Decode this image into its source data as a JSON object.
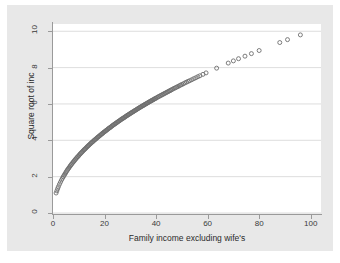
{
  "figure": {
    "width": 340,
    "height": 263,
    "background_color": "#ffffff",
    "graph_region_color": "#e8e8e8",
    "plot_area_color": "#ffffff",
    "gridline_color": "#d4d4d4",
    "axis_color": "#9a9a9a",
    "marker_color": "#6e6e6e"
  },
  "chart_data": {
    "type": "scatter",
    "title": "",
    "subtitle": "",
    "xlabel": "Family income excluding wife's",
    "ylabel": "Square root of inc",
    "xlim": [
      0,
      104
    ],
    "ylim": [
      0,
      10.4
    ],
    "xticks": [
      0,
      20,
      40,
      60,
      80,
      100
    ],
    "yticks": [
      0,
      2,
      4,
      6,
      8,
      10
    ],
    "xtick_labels": [
      "0",
      "20",
      "40",
      "60",
      "80",
      "100"
    ],
    "ytick_labels": [
      "0",
      "2",
      "4",
      "6",
      "8",
      "10"
    ],
    "grid": "horizontal",
    "legend": "none",
    "marker": "open-circle",
    "marker_size": 4,
    "annotations": [],
    "relation": "y = sqrt(x)",
    "series": [
      {
        "name": "Square root of inc",
        "x": [
          1.2,
          1.5,
          1.8,
          2.1,
          2.5,
          2.9,
          3.3,
          3.7,
          4.0,
          4.3,
          4.6,
          4.9,
          5.2,
          5.5,
          5.8,
          6.1,
          6.4,
          6.7,
          7.0,
          7.3,
          7.6,
          7.9,
          8.2,
          8.5,
          8.8,
          9.1,
          9.4,
          9.7,
          10.0,
          10.3,
          10.6,
          10.9,
          11.2,
          11.5,
          11.8,
          12.1,
          12.4,
          12.7,
          13.0,
          13.3,
          13.6,
          13.9,
          14.2,
          14.5,
          14.8,
          15.1,
          15.4,
          15.7,
          16.0,
          16.3,
          16.6,
          16.9,
          17.2,
          17.5,
          17.8,
          18.1,
          18.4,
          18.7,
          19.0,
          19.3,
          19.6,
          19.9,
          20.2,
          20.5,
          20.8,
          21.1,
          21.4,
          21.7,
          22.0,
          22.3,
          22.6,
          22.9,
          23.2,
          23.5,
          23.8,
          24.1,
          24.4,
          24.7,
          25.0,
          25.3,
          25.6,
          25.9,
          26.2,
          26.5,
          26.8,
          27.1,
          27.4,
          27.7,
          28.0,
          28.3,
          28.6,
          28.9,
          29.2,
          29.5,
          29.8,
          30.1,
          30.4,
          30.7,
          31.0,
          31.3,
          31.6,
          31.9,
          32.2,
          32.5,
          32.8,
          33.1,
          33.4,
          33.7,
          34.0,
          34.3,
          34.6,
          34.9,
          35.2,
          35.5,
          35.8,
          36.1,
          36.4,
          36.7,
          37.0,
          37.3,
          37.6,
          37.9,
          38.2,
          38.5,
          38.8,
          39.1,
          39.4,
          39.7,
          40.0,
          40.4,
          40.8,
          41.2,
          41.6,
          42.0,
          42.4,
          42.8,
          43.2,
          43.6,
          44.0,
          44.4,
          44.8,
          45.2,
          45.6,
          46.0,
          46.5,
          47.0,
          47.5,
          48.0,
          48.5,
          49.0,
          49.5,
          50.0,
          50.6,
          51.2,
          51.8,
          52.4,
          53.0,
          53.8,
          54.6,
          55.4,
          56.2,
          57.0,
          58.2,
          59.4,
          63.5,
          68.0,
          70.0,
          72.0,
          74.5,
          77.0,
          80.0,
          88.0,
          91.0,
          96.0
        ],
        "y": [
          1.1,
          1.22,
          1.34,
          1.45,
          1.58,
          1.7,
          1.82,
          1.92,
          2.0,
          2.07,
          2.14,
          2.21,
          2.28,
          2.35,
          2.41,
          2.47,
          2.53,
          2.59,
          2.65,
          2.7,
          2.76,
          2.81,
          2.86,
          2.92,
          2.97,
          3.02,
          3.07,
          3.11,
          3.16,
          3.21,
          3.26,
          3.3,
          3.35,
          3.39,
          3.44,
          3.48,
          3.52,
          3.56,
          3.61,
          3.65,
          3.69,
          3.73,
          3.77,
          3.81,
          3.85,
          3.89,
          3.92,
          3.96,
          4.0,
          4.04,
          4.07,
          4.11,
          4.15,
          4.18,
          4.22,
          4.25,
          4.29,
          4.32,
          4.36,
          4.39,
          4.43,
          4.46,
          4.49,
          4.53,
          4.56,
          4.59,
          4.63,
          4.66,
          4.69,
          4.72,
          4.75,
          4.79,
          4.82,
          4.85,
          4.88,
          4.91,
          4.94,
          4.97,
          5.0,
          5.03,
          5.06,
          5.09,
          5.12,
          5.15,
          5.18,
          5.21,
          5.23,
          5.26,
          5.29,
          5.32,
          5.35,
          5.38,
          5.4,
          5.43,
          5.46,
          5.49,
          5.51,
          5.54,
          5.57,
          5.59,
          5.62,
          5.65,
          5.67,
          5.7,
          5.73,
          5.75,
          5.78,
          5.81,
          5.83,
          5.86,
          5.88,
          5.91,
          5.93,
          5.96,
          5.98,
          6.01,
          6.03,
          6.06,
          6.08,
          6.11,
          6.13,
          6.16,
          6.18,
          6.2,
          6.23,
          6.25,
          6.28,
          6.3,
          6.32,
          6.36,
          6.39,
          6.42,
          6.45,
          6.48,
          6.51,
          6.54,
          6.57,
          6.6,
          6.63,
          6.66,
          6.69,
          6.72,
          6.75,
          6.78,
          6.82,
          6.86,
          6.89,
          6.93,
          6.96,
          7.0,
          7.04,
          7.07,
          7.11,
          7.16,
          7.2,
          7.24,
          7.28,
          7.33,
          7.39,
          7.44,
          7.5,
          7.55,
          7.63,
          7.71,
          7.97,
          8.25,
          8.37,
          8.49,
          8.63,
          8.77,
          8.94,
          9.38,
          9.54,
          9.8
        ]
      }
    ]
  }
}
